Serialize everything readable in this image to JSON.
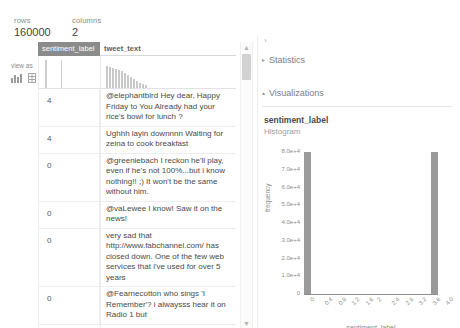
{
  "summary": {
    "rows_label": "rows",
    "rows_value": "160000",
    "columns_label": "columns",
    "columns_value": "2"
  },
  "view_as": {
    "label": "view as",
    "icons": [
      "bar-chart-icon",
      "table-icon"
    ]
  },
  "grid": {
    "columns": [
      {
        "name": "sentiment_label",
        "selected": true
      },
      {
        "name": "tweet_text",
        "selected": false
      }
    ],
    "sparklines": {
      "sentiment_label": [
        28,
        28
      ],
      "tweet_text": [
        22,
        21,
        20,
        19,
        18,
        17,
        15,
        13,
        11,
        9,
        7,
        5,
        4,
        3
      ]
    },
    "rows": [
      {
        "sentiment_label": "4",
        "tweet_text": "@elephantbird Hey dear, Happy Friday to You Already had your rice's bowl for lunch ?"
      },
      {
        "sentiment_label": "4",
        "tweet_text": "Ughhh layin downnnn    Waiting for zeina to cook breakfast"
      },
      {
        "sentiment_label": "0",
        "tweet_text": "@greeniebach I reckon he'll play, even if he's not 100%...but i know nothing!! ;) It won't be the same without him."
      },
      {
        "sentiment_label": "0",
        "tweet_text": "@vaLewee I know! Saw it on the news!"
      },
      {
        "sentiment_label": "0",
        "tweet_text": "very sad that http://www.fabchannel.com/ has closed down. One of the few web services that i've used for over 5 years"
      },
      {
        "sentiment_label": "0",
        "tweet_text": "@Fearnecotton who sings 'I Remember'? i alwaysss hear it on Radio 1 but"
      }
    ]
  },
  "scrollbar": {
    "up_arrow": "▲",
    "down_arrow": "▼"
  },
  "side_panel": {
    "collapse_chevron": "›",
    "sections": [
      {
        "name": "Statistics",
        "expanded": false,
        "marker": "▸"
      },
      {
        "name": "Visualizations",
        "expanded": true,
        "marker": "▴"
      }
    ],
    "visualization": {
      "title": "sentiment_label",
      "subtitle": "Histogram"
    }
  },
  "chart_data": {
    "type": "bar",
    "title": "",
    "xlabel": "sentiment_label",
    "ylabel": "frequency",
    "xlim": [
      0,
      4.0
    ],
    "ylim": [
      0,
      80000
    ],
    "grid": false,
    "legend": null,
    "bar_width": 0.2,
    "x": [
      0,
      4.0
    ],
    "values": [
      80000,
      80000
    ],
    "xticks": [
      "0",
      "0.4",
      "0.8",
      "1.2",
      "1.6",
      "2",
      "2.4",
      "2.8",
      "3.2",
      "3.6",
      "4.0"
    ],
    "yticks": [
      "0",
      "1.0e+4",
      "2.0e+4",
      "3.0e+4",
      "4.0e+4",
      "5.0e+4",
      "6.0e+4",
      "7.0e+4",
      "8.0e+4"
    ],
    "bar_color": "#9a9a9a"
  }
}
